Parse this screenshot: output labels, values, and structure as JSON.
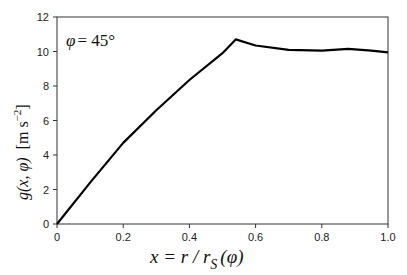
{
  "chart_data": {
    "type": "line",
    "title": "",
    "annotation": "φ = 45°",
    "xlabel": "x = r / r_S (φ)",
    "ylabel": "g(x, φ)  [m s⁻²]",
    "xlim": [
      0,
      1.0
    ],
    "ylim": [
      0,
      12
    ],
    "xticks": [
      "0",
      "0.2",
      "0.4",
      "0.6",
      "0.8",
      "1.0"
    ],
    "yticks": [
      "0",
      "2",
      "4",
      "6",
      "8",
      "10",
      "12"
    ],
    "grid": false,
    "legend": null,
    "series": [
      {
        "name": "g(x, φ=45°)",
        "x": [
          0,
          0.1,
          0.2,
          0.3,
          0.4,
          0.5,
          0.54,
          0.6,
          0.7,
          0.8,
          0.88,
          0.95,
          1.0
        ],
        "y": [
          0,
          2.4,
          4.7,
          6.6,
          8.35,
          9.9,
          10.7,
          10.35,
          10.1,
          10.05,
          10.15,
          10.05,
          9.95
        ]
      }
    ]
  },
  "labels": {
    "annotation_phi": "φ",
    "annotation_eq": "= 45°",
    "x_axis_label": "x = r / r",
    "x_axis_sub": "S",
    "x_axis_tail": "(φ)",
    "y_axis_label_main": "g(x, φ)",
    "y_axis_units": "[m s",
    "y_axis_exp": "−2",
    "y_axis_close": "]"
  }
}
